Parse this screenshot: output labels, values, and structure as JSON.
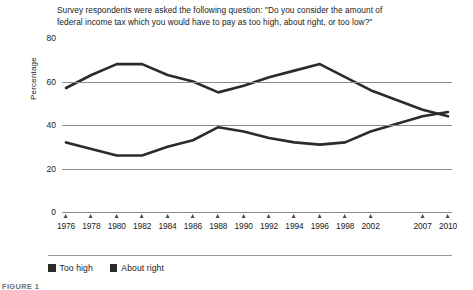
{
  "figure": {
    "title_lines": [
      "Survey respondents were asked the following question: \"Do you consider the amount of",
      "federal income tax which you would have to pay as too high, about right, or too low?\""
    ],
    "caption": "FIGURE 1"
  },
  "legend": {
    "items": [
      {
        "label": "Too high",
        "color": "#2b2b2b",
        "icon": "square-swatch"
      },
      {
        "label": "About right",
        "color": "#2b2b2b",
        "icon": "square-swatch"
      }
    ]
  },
  "chart_data": {
    "type": "line",
    "title": "Survey respondents were asked the following question: \"Do you consider the amount of federal income tax which you would have to pay as too high, about right, or too low?\"",
    "xlabel": "",
    "ylabel": "Percentage",
    "categories": [
      "1976",
      "1978",
      "1980",
      "1982",
      "1984",
      "1986",
      "1988",
      "1990",
      "1992",
      "1994",
      "1996",
      "1998",
      "2002",
      "2007",
      "2010"
    ],
    "ylim": [
      0,
      80
    ],
    "yticks": [
      0,
      20,
      40,
      60,
      80
    ],
    "grid": "horizontal",
    "legend_position": "bottom",
    "series": [
      {
        "name": "Too high",
        "color": "#2b2b2b",
        "values": [
          57,
          63,
          68,
          68,
          63,
          60,
          55,
          58,
          62,
          65,
          68,
          62,
          56,
          47,
          44
        ]
      },
      {
        "name": "About right",
        "color": "#2b2b2b",
        "values": [
          32,
          29,
          26,
          26,
          30,
          33,
          39,
          37,
          34,
          32,
          31,
          32,
          37,
          44,
          46
        ]
      }
    ]
  }
}
